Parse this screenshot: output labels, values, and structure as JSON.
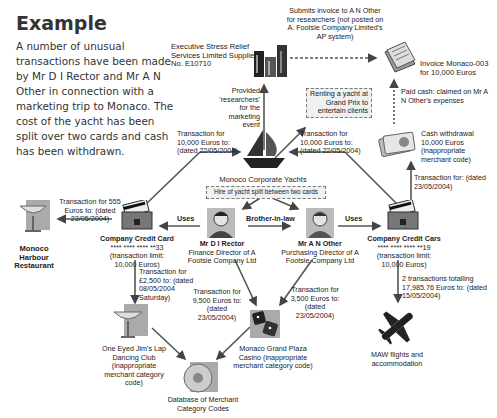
{
  "heading": "Example",
  "intro": "A number of unusual transactions have been made by Mr D I Rector and Mr A N Other in connection with a marketing trip to Monaco. The cost of the yacht has been split over two cards and cash has been withdrawn.",
  "nodes": {
    "supplier": "Executive Stress Relief Services Limited Supplier No. E10710",
    "invoice": "Invoice Monaco-003 for 10,000 Euros",
    "yachts": "Monoco Corporate Yachts",
    "yacht_split": "Hire of yacht split between two cards",
    "renting_note": "Renting a yacht at Grand Prix to entertain clients",
    "cash": "Cash withdrawal 10,000 Euros (inappropriate merchant code)",
    "card1": {
      "title": "Company Credit Card",
      "number": "**** **** **** **33",
      "limit": "(transaction limit: 10,000 Euros)"
    },
    "card2": {
      "title": "Company Credit Cars",
      "number": "**** **** **** **19",
      "limit": "(transaction limit: 10,000 Euros)"
    },
    "rector": {
      "name": "Mr D I Rector",
      "role": "Finance Director of A Footsie Company Ltd"
    },
    "other": {
      "name": "Mr A N Other",
      "role": "Purchasing Director of A Footsie Company Ltd"
    },
    "restaurant": "Monoco Harbour Restaurant",
    "club": "One Eyed Jim's Lap Dancing Club (inappropriate merchant category code)",
    "casino": "Monaco Grand Plaza Casino (inappropriate merchant category code)",
    "database": "Database of Merchant Category Codes",
    "flights": "MAW flights and accommodation"
  },
  "edges": {
    "submits_invoice": "Submits invoice to A N Other for researchers (not posted on A. Footsie Company Limited's AP system)",
    "provided": "Provided 'researchers' for the marketing event",
    "paid_cash": "Paid cash: claimed on Mr A N Other's expenses",
    "txn_left_yacht": "Transaction for 10,000 Euros to: (dated 22/05/2004)",
    "txn_right_yacht": "Transaction for 10,000 Euros to: (dated 22/05/2004)",
    "txn_restaurant": "Transaction for 555 Euros to: (dated 23/05/2004)",
    "txn_cash": "Transaction for: (dated 23/05/2004)",
    "uses_left": "Uses",
    "uses_right": "Uses",
    "brother": "Brother-in-law",
    "txn_club": "Transaction for £2,500 to: (dated 08/05/2004 Saturday)",
    "txn_casino_rector": "Transaction for 9,500 Euros to: (dated 23/05/2004)",
    "txn_casino_other": "Transaction for 3,500 Euros to: (dated 23/05/2004)",
    "txn_flights": "2 transactions totalling 17,985.76 Euros to: (dated 15/05/2004)"
  }
}
